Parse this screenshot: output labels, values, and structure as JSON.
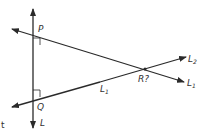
{
  "diagram": {
    "points": {
      "P": {
        "label": "P",
        "x": 33,
        "y": 36
      },
      "Q": {
        "label": "Q",
        "x": 33,
        "y": 97
      },
      "R": {
        "label": "R",
        "suffix": "?",
        "x": 145,
        "y": 69
      }
    },
    "lines": {
      "L": {
        "label": "L",
        "sub": ""
      },
      "L1": {
        "label": "L",
        "sub": "1"
      },
      "L2": {
        "label": "L",
        "sub": "2"
      },
      "L1_mid": {
        "label": "L",
        "sub": "1"
      }
    },
    "stray_char": "t",
    "stroke_color": "#2a2a2a"
  }
}
